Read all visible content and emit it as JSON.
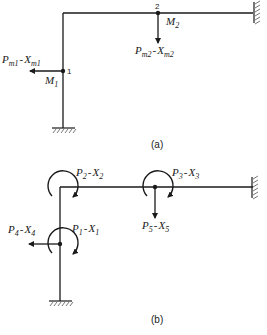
{
  "figure_a": {
    "caption": "(a)",
    "node1": {
      "number": "1",
      "moment": "M",
      "moment_sub": "1",
      "force": "P",
      "force_sub": "m1",
      "disp": "X",
      "disp_sub": "m1"
    },
    "node2": {
      "number": "2",
      "moment": "M",
      "moment_sub": "2",
      "force": "P",
      "force_sub": "m2",
      "disp": "X",
      "disp_sub": "m2"
    },
    "supports": [
      "fixed-right-wall",
      "fixed-base"
    ]
  },
  "figure_b": {
    "caption": "(b)",
    "dofs": [
      {
        "p": "P",
        "p_sub": "1",
        "x": "X",
        "x_sub": "1",
        "type": "rotation",
        "location": "node-1"
      },
      {
        "p": "P",
        "p_sub": "2",
        "x": "X",
        "x_sub": "2",
        "type": "rotation",
        "location": "corner"
      },
      {
        "p": "P",
        "p_sub": "3",
        "x": "X",
        "x_sub": "3",
        "type": "rotation",
        "location": "node-2"
      },
      {
        "p": "P",
        "p_sub": "4",
        "x": "X",
        "x_sub": "4",
        "type": "horizontal",
        "location": "node-1"
      },
      {
        "p": "P",
        "p_sub": "5",
        "x": "X",
        "x_sub": "5",
        "type": "vertical",
        "location": "node-2"
      }
    ],
    "supports": [
      "fixed-right-wall",
      "fixed-base"
    ]
  },
  "separator": "-",
  "colors": {
    "line": "#1a1a1a",
    "background": "#ffffff"
  }
}
